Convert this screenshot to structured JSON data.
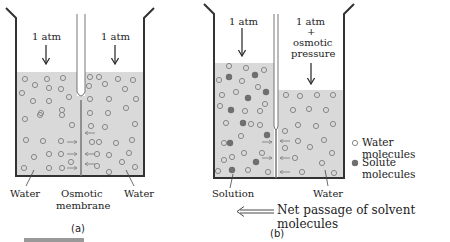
{
  "figure": {
    "panel_a": {
      "label": "(a)",
      "left_pressure": "1 atm",
      "right_pressure": "1 atm",
      "left_label": "Water",
      "center_label_line1": "Osmotic",
      "center_label_line2": "membrane",
      "right_label": "Water"
    },
    "panel_b": {
      "label": "(b)",
      "left_pressure": "1 atm",
      "right_pressure_line1": "1 atm",
      "right_pressure_line2": "+",
      "right_pressure_line3": "osmotic",
      "right_pressure_line4": "pressure",
      "left_label": "Solution",
      "right_label": "Water"
    },
    "legend": {
      "water": "Water molecules",
      "solute": "Solute molecules"
    },
    "net_passage": "Net passage of solvent molecules",
    "colors": {
      "liquid": "#d9d9d9",
      "solute": "#6f6f6f",
      "line": "#333333"
    }
  }
}
